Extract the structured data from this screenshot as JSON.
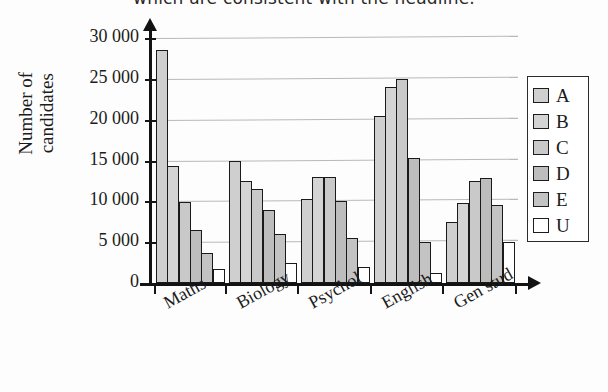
{
  "chart_data": {
    "type": "bar",
    "title": "which are consistent with the headline.",
    "xlabel": "",
    "ylabel": "Number of candidates",
    "ylabel_lines": [
      "Number of",
      "candidates"
    ],
    "categories": [
      "Maths",
      "Biology",
      "Psychol",
      "English",
      "Gen stud"
    ],
    "series": [
      {
        "name": "A",
        "color": "#cfcfcf",
        "values": [
          28500,
          15000,
          10300,
          20500,
          7500
        ]
      },
      {
        "name": "B",
        "color": "#d4d4d4",
        "values": [
          14300,
          12500,
          13000,
          24000,
          9800
        ]
      },
      {
        "name": "C",
        "color": "#c9c9c9",
        "values": [
          9900,
          11500,
          13000,
          25000,
          12500
        ]
      },
      {
        "name": "D",
        "color": "#bdbdbd",
        "values": [
          6500,
          9000,
          10000,
          15300,
          12800
        ]
      },
      {
        "name": "E",
        "color": "#c3c3c3",
        "values": [
          3700,
          6000,
          5500,
          5000,
          9600
        ]
      },
      {
        "name": "U",
        "color": "#ffffff",
        "values": [
          1700,
          2500,
          2000,
          1200,
          5000
        ]
      }
    ],
    "legend": {
      "position": "right",
      "entries": [
        "A",
        "B",
        "C",
        "D",
        "E",
        "U"
      ]
    },
    "ylim": [
      0,
      30000
    ],
    "ytick_values": [
      0,
      5000,
      10000,
      15000,
      20000,
      25000,
      30000
    ],
    "ytick_labels": [
      "0",
      "5 000",
      "10 000",
      "15 000",
      "20 000",
      "25 000",
      "30 000"
    ],
    "grid": true,
    "grid_axis": "y"
  }
}
